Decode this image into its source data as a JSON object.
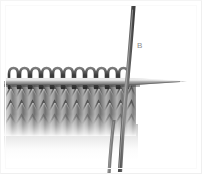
{
  "figure": {
    "background_color": "#ffffff",
    "width": 202,
    "height": 174
  },
  "labels": [
    {
      "id": "label-b",
      "text": "B",
      "color": "#8d8d8d",
      "x": 137,
      "y": 41,
      "refers_to": "diagonal-needle"
    }
  ],
  "objects": {
    "horizontal_needle": {
      "name": "horizontal-needle",
      "description": "straight knitting needle running left to right with tapered point at right",
      "color": "#9a9a9a",
      "shadow_color": "#6b6b6b",
      "tip_x": 188,
      "y": 82
    },
    "diagonal_needle": {
      "name": "diagonal-needle",
      "description": "second knitting needle crossing from upper right to lower left",
      "color": "#6e6e6e",
      "top_x": 133,
      "bottom_x": 108
    },
    "yarn_tail": {
      "name": "yarn-tail",
      "description": "working yarn strand hanging below the fabric",
      "color": "#787878"
    },
    "fabric": {
      "name": "knitted-fabric",
      "description": "stockinette stitch knitted swatch in grey yarn",
      "color": "#a3a3a3",
      "stitch_count": 11,
      "visible_rows": 3
    },
    "loops": {
      "name": "stitch-loops",
      "description": "row of live stitches seated on the horizontal needle",
      "count": 11,
      "color": "#4f4f4f"
    }
  }
}
